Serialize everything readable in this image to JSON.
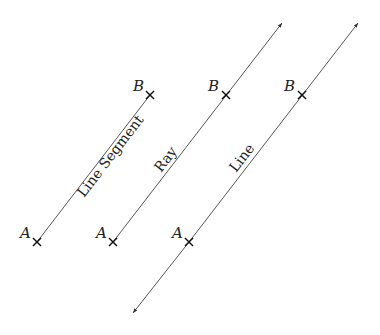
{
  "figures": [
    {
      "type": "segment",
      "caption": "Line Segment",
      "point_a": "A",
      "point_b": "B"
    },
    {
      "type": "ray",
      "caption": "Ray",
      "point_a": "A",
      "point_b": "B"
    },
    {
      "type": "line",
      "caption": "Line",
      "point_a": "A",
      "point_b": "B"
    }
  ]
}
